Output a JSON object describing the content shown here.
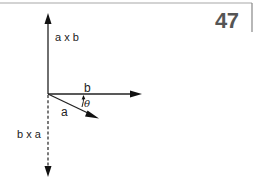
{
  "page": {
    "number": "47",
    "frame_color": "#999999",
    "number_color": "#555555"
  },
  "diagram": {
    "origin": {
      "x": 48,
      "y": 94
    },
    "vectors": [
      {
        "id": "axb",
        "label": "a x b",
        "style": "solid",
        "direction": "up"
      },
      {
        "id": "b",
        "label": "b",
        "style": "solid",
        "direction": "right"
      },
      {
        "id": "a",
        "label": "a",
        "style": "solid",
        "direction": "down-right"
      },
      {
        "id": "bxa",
        "label": "b x a",
        "style": "dashed",
        "direction": "down"
      }
    ],
    "angle": {
      "label": "θ",
      "between": [
        "a",
        "b"
      ]
    },
    "line_color": "#222222"
  }
}
